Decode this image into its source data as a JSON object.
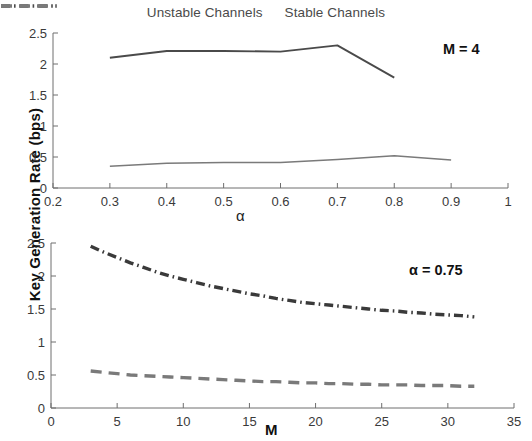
{
  "legend": {
    "position": "top-center",
    "entries": [
      {
        "label": "Unstable Channels",
        "style": "dash-dot",
        "color": "#4a4a4a"
      },
      {
        "label": "Stable Channels",
        "style": "dashed",
        "color": "#7a7a7a"
      }
    ]
  },
  "shared": {
    "ylabel": "Key Generation Rate (bps)"
  },
  "chart_data": [
    {
      "type": "line",
      "panel": "top",
      "title": "",
      "xlabel": "α",
      "ylabel": "Key Generation Rate (bps)",
      "annotation": "M = 4",
      "xlim": [
        0.2,
        1.0
      ],
      "ylim": [
        0,
        2.5
      ],
      "xticks": [
        "0.2",
        "0.3",
        "0.4",
        "0.5",
        "0.6",
        "0.7",
        "0.8",
        "0.9",
        "1"
      ],
      "xtick_values": [
        0.2,
        0.3,
        0.4,
        0.5,
        0.6,
        0.7,
        0.8,
        0.9,
        1.0
      ],
      "yticks": [
        "0",
        "0.5",
        "1",
        "1.5",
        "2",
        "2.5"
      ],
      "ytick_values": [
        0,
        0.5,
        1,
        1.5,
        2,
        2.5
      ],
      "grid": false,
      "series": [
        {
          "name": "Unstable Channels",
          "style": "dash-dot",
          "color": "#4a4a4a",
          "x": [
            0.3,
            0.4,
            0.5,
            0.6,
            0.7,
            0.8
          ],
          "values": [
            2.1,
            2.21,
            2.21,
            2.2,
            2.3,
            1.78
          ]
        },
        {
          "name": "Stable Channels",
          "style": "dashed",
          "color": "#7a7a7a",
          "x": [
            0.3,
            0.4,
            0.5,
            0.6,
            0.7,
            0.8,
            0.9
          ],
          "values": [
            0.35,
            0.4,
            0.41,
            0.41,
            0.46,
            0.52,
            0.45
          ]
        }
      ]
    },
    {
      "type": "line",
      "panel": "bottom",
      "title": "",
      "xlabel": "M",
      "ylabel": "Key Generation Rate (bps)",
      "annotation": "α = 0.75",
      "xlim": [
        0,
        35
      ],
      "ylim": [
        0,
        2.5
      ],
      "xticks": [
        "0",
        "5",
        "10",
        "15",
        "20",
        "25",
        "30",
        "35"
      ],
      "xtick_values": [
        0,
        5,
        10,
        15,
        20,
        25,
        30,
        35
      ],
      "yticks": [
        "0",
        "0.5",
        "1",
        "1.5",
        "2",
        "2.5"
      ],
      "ytick_values": [
        0,
        0.5,
        1,
        1.5,
        2,
        2.5
      ],
      "grid": false,
      "series": [
        {
          "name": "Unstable Channels",
          "style": "dash-dot",
          "color": "#3a3a3a",
          "x": [
            3,
            4,
            5,
            6,
            7,
            8,
            9,
            10,
            11,
            12,
            13,
            14,
            15,
            16,
            17,
            18,
            19,
            20,
            21,
            22,
            23,
            24,
            25,
            26,
            27,
            28,
            29,
            30,
            31,
            32
          ],
          "values": [
            2.45,
            2.36,
            2.28,
            2.2,
            2.13,
            2.06,
            2.0,
            1.95,
            1.9,
            1.85,
            1.81,
            1.77,
            1.73,
            1.7,
            1.66,
            1.63,
            1.6,
            1.58,
            1.56,
            1.54,
            1.52,
            1.5,
            1.48,
            1.47,
            1.45,
            1.44,
            1.42,
            1.41,
            1.4,
            1.38
          ]
        },
        {
          "name": "Stable Channels",
          "style": "dashed",
          "color": "#7a7a7a",
          "x": [
            3,
            4,
            5,
            6,
            7,
            8,
            9,
            10,
            11,
            12,
            13,
            14,
            15,
            16,
            17,
            18,
            19,
            20,
            21,
            22,
            23,
            24,
            25,
            26,
            27,
            28,
            29,
            30,
            31,
            32
          ],
          "values": [
            0.56,
            0.54,
            0.52,
            0.5,
            0.49,
            0.48,
            0.47,
            0.46,
            0.45,
            0.44,
            0.43,
            0.42,
            0.41,
            0.4,
            0.4,
            0.39,
            0.38,
            0.38,
            0.37,
            0.37,
            0.36,
            0.36,
            0.35,
            0.35,
            0.35,
            0.34,
            0.34,
            0.34,
            0.33,
            0.33
          ]
        }
      ]
    }
  ]
}
